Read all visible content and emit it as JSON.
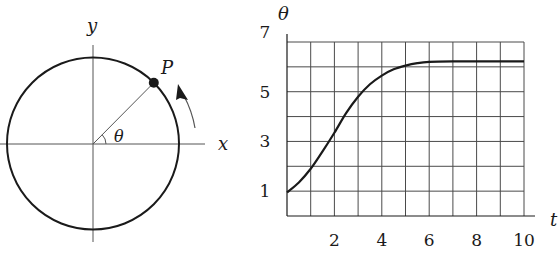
{
  "left_diagram": {
    "axis_x_label": "x",
    "axis_y_label": "y",
    "point_label": "P",
    "angle_label": "θ",
    "circle": {
      "cx": 93,
      "cy": 143.5,
      "r": 86
    },
    "point_angle_deg": 45,
    "rotation_direction": "counterclockwise"
  },
  "chart_data": {
    "type": "line",
    "title": "",
    "xlabel": "t",
    "ylabel": "θ",
    "xlim": [
      0,
      10
    ],
    "ylim": [
      0,
      7
    ],
    "x_ticks": [
      2,
      4,
      6,
      8,
      10
    ],
    "y_ticks": [
      1,
      3,
      5,
      7
    ],
    "grid": true,
    "grid_x_step": 1,
    "grid_y_step": 1,
    "series": [
      {
        "name": "θ(t)",
        "x": [
          0,
          0.5,
          1,
          1.5,
          2,
          2.5,
          3,
          3.5,
          4,
          4.5,
          5,
          5.5,
          6,
          7,
          8,
          9,
          10
        ],
        "values": [
          0.95,
          1.35,
          1.9,
          2.6,
          3.35,
          4.15,
          4.8,
          5.3,
          5.65,
          5.9,
          6.05,
          6.15,
          6.2,
          6.22,
          6.22,
          6.22,
          6.22
        ]
      }
    ],
    "legend": null
  },
  "colors": {
    "ink": "#1a1a1a",
    "grid": "#4a4a4a",
    "background": "#ffffff"
  }
}
